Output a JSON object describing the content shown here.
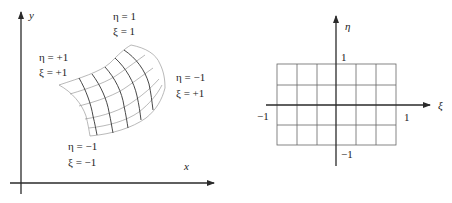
{
  "physical_domain": {
    "x_axis_label": "x",
    "y_axis_label": "y",
    "corner_labels": [
      {
        "eta": "η = 1",
        "xi": "ξ = 1",
        "position": "top"
      },
      {
        "eta": "η = +1",
        "xi": "ξ = +1",
        "position": "left"
      },
      {
        "eta": "η = −1",
        "xi": "ξ = +1",
        "position": "right"
      },
      {
        "eta": "η = −1",
        "xi": "ξ = −1",
        "position": "bottom"
      }
    ]
  },
  "reference_domain": {
    "xi_axis_label": "ξ",
    "eta_axis_label": "η",
    "tick_labels": {
      "xi_min": "−1",
      "xi_max": "1",
      "eta_max": "1",
      "eta_min": "−1"
    },
    "grid": {
      "columns": 6,
      "rows": 4
    }
  }
}
